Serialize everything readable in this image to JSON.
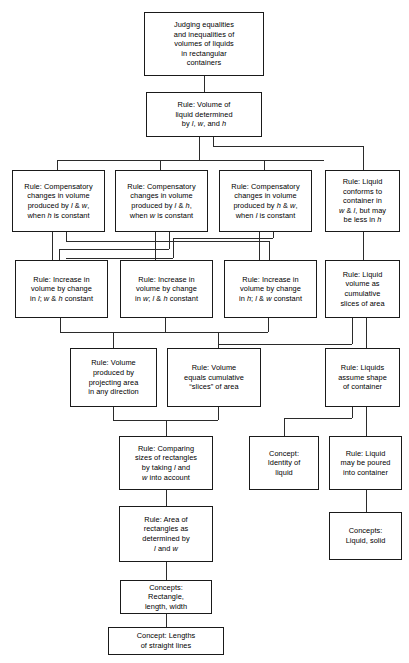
{
  "diagram": {
    "type": "hierarchy-flowchart",
    "nodes": [
      {
        "id": "n1",
        "data_name": "node-judging-equalities",
        "text": "Judging equalities\nand inequalities of\nvolumes of liquids\nin rectangular\ncontainers"
      },
      {
        "id": "n2",
        "data_name": "node-rule-volume-determined",
        "text": "Rule:  Volume of\nliquid determined\nby l, w, and h"
      },
      {
        "id": "n3",
        "data_name": "node-rule-compensatory-l-w",
        "text": "Rule: Compensatory\nchanges in volume\nproduced by l & w,\nwhen h is constant"
      },
      {
        "id": "n4",
        "data_name": "node-rule-compensatory-l-h",
        "text": "Rule: Compensatory\nchanges in volume\nproduced by l & h,\nwhen w is constant"
      },
      {
        "id": "n5",
        "data_name": "node-rule-compensatory-h-w",
        "text": "Rule: Compensatory\nchanges in volume\nproduced by h & w,\nwhen l is constant"
      },
      {
        "id": "n6",
        "data_name": "node-rule-liquid-conforms",
        "text": "Rule: Liquid\nconforms to\ncontainer in\nw & l, but may\nbe less in h"
      },
      {
        "id": "n7",
        "data_name": "node-rule-increase-l",
        "text": "Rule:  Increase in\nvolume by change\nin l; w & h constant"
      },
      {
        "id": "n8",
        "data_name": "node-rule-increase-w",
        "text": "Rule:  Increase in\nvolume by change\nin w; l & h constant"
      },
      {
        "id": "n9",
        "data_name": "node-rule-increase-h",
        "text": "Rule:  Increase in\nvolume by change\nin h; l & w constant"
      },
      {
        "id": "n10",
        "data_name": "node-rule-cumulative-slices-area",
        "text": "Rule: Liquid\nvolume as\ncumulative\nslices of area"
      },
      {
        "id": "n11",
        "data_name": "node-rule-volume-projecting-area",
        "text": "Rule:  Volume\nproduced by\nprojecting area\nin any direction"
      },
      {
        "id": "n12",
        "data_name": "node-rule-volume-equals-slices",
        "text": "Rule:  Volume\nequals cumulative\n“slices” of area"
      },
      {
        "id": "n13",
        "data_name": "node-rule-liquids-assume-shape",
        "text": "Rule: Liquids\nassume shape\nof container"
      },
      {
        "id": "n14",
        "data_name": "node-rule-comparing-rectangles",
        "text": "Rule:  Comparing\nsizes of rectangles\nby taking l and\nw into account"
      },
      {
        "id": "n15",
        "data_name": "node-concept-identity-of-liquid",
        "text": "Concept:\nIdentity of\nliquid"
      },
      {
        "id": "n16",
        "data_name": "node-rule-liquid-poured",
        "text": "Rule:  Liquid\nmay be poured\ninto container"
      },
      {
        "id": "n17",
        "data_name": "node-rule-area-rectangles",
        "text": "Rule:  Area of\nrectangles as\ndetermined by\nl and w"
      },
      {
        "id": "n18",
        "data_name": "node-concepts-liquid-solid",
        "text": "Concepts:\nLiquid, solid"
      },
      {
        "id": "n19",
        "data_name": "node-concepts-rectangle",
        "text": "Concepts:\nRectangle,\nlength, width"
      },
      {
        "id": "n20",
        "data_name": "node-concept-lengths-straight-lines",
        "text": "Concept: Lengths\nof straight lines"
      }
    ]
  }
}
